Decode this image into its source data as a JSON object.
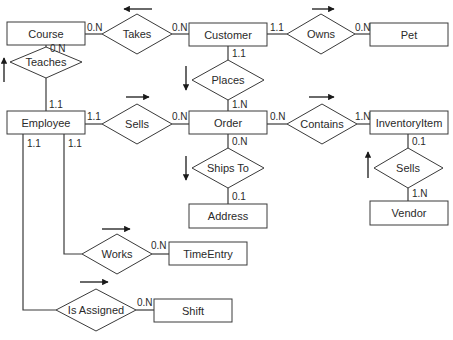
{
  "diagram": {
    "type": "entity-relationship",
    "entities": {
      "course": "Course",
      "customer": "Customer",
      "pet": "Pet",
      "employee": "Employee",
      "order": "Order",
      "inventory_item": "InventoryItem",
      "address": "Address",
      "vendor": "Vendor",
      "time_entry": "TimeEntry",
      "shift": "Shift"
    },
    "relationships": {
      "takes": "Takes",
      "owns": "Owns",
      "teaches": "Teaches",
      "places": "Places",
      "sells_emp": "Sells",
      "contains": "Contains",
      "ships_to": "Ships To",
      "sells_vendor": "Sells",
      "works": "Works",
      "is_assigned": "Is Assigned"
    },
    "cardinalities": {
      "course_takes": "0.N",
      "customer_takes": "0.N",
      "customer_owns": "1.1",
      "pet_owns": "0.N",
      "course_teaches": "0.N",
      "employee_teaches": "1.1",
      "customer_places": "1.1",
      "order_places": "1.N",
      "employee_sells": "1.1",
      "order_sells": "0.N",
      "order_contains": "0.N",
      "inventory_contains": "1.N",
      "order_shipsto": "0.N",
      "address_shipsto": "0.1",
      "inventory_sells": "0.1",
      "vendor_sells": "1.N",
      "employee_works": "1.1",
      "timeentry_works": "0.N",
      "employee_assigned": "1.1",
      "shift_assigned": "0.N"
    },
    "links": [
      {
        "from": "Course",
        "rel": "Takes",
        "to": "Customer",
        "reading_direction": "left"
      },
      {
        "from": "Customer",
        "rel": "Owns",
        "to": "Pet",
        "reading_direction": "right"
      },
      {
        "from": "Employee",
        "rel": "Teaches",
        "to": "Course",
        "reading_direction": "up"
      },
      {
        "from": "Customer",
        "rel": "Places",
        "to": "Order",
        "reading_direction": "down"
      },
      {
        "from": "Employee",
        "rel": "Sells",
        "to": "Order",
        "reading_direction": "right"
      },
      {
        "from": "Order",
        "rel": "Contains",
        "to": "InventoryItem",
        "reading_direction": "right"
      },
      {
        "from": "Order",
        "rel": "Ships To",
        "to": "Address",
        "reading_direction": "down"
      },
      {
        "from": "Vendor",
        "rel": "Sells",
        "to": "InventoryItem",
        "reading_direction": "up"
      },
      {
        "from": "Employee",
        "rel": "Works",
        "to": "TimeEntry",
        "reading_direction": "right"
      },
      {
        "from": "Employee",
        "rel": "Is Assigned",
        "to": "Shift",
        "reading_direction": "right"
      }
    ],
    "colors": {
      "stroke": "#3a3a3a",
      "text": "#2a2a2a",
      "background": "#ffffff"
    }
  }
}
